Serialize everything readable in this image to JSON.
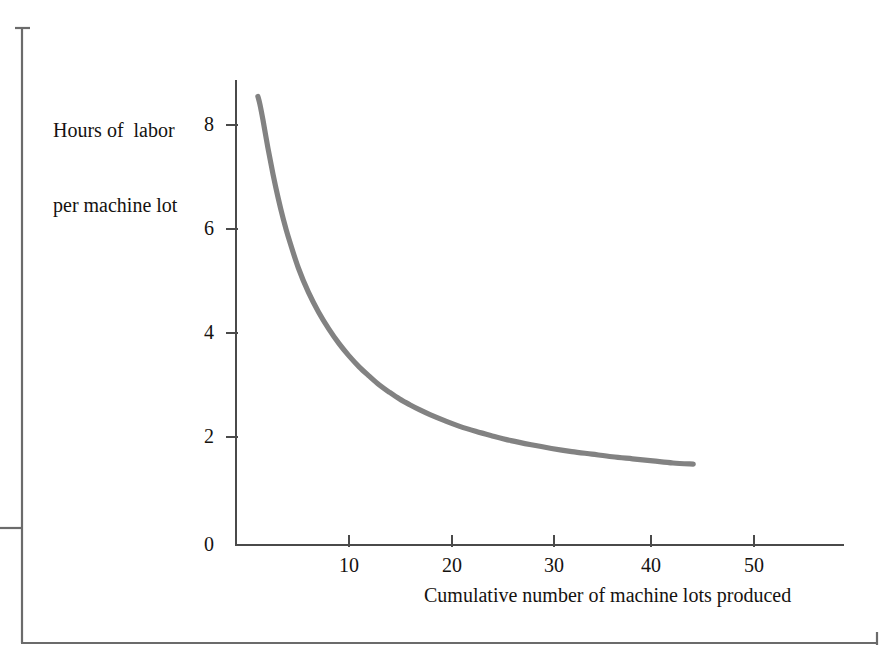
{
  "figure": {
    "background_color": "#ffffff",
    "axis_color": "#4a4a4a",
    "curve_color": "#828282",
    "text_color": "#15120f",
    "frame": {
      "name": "page-rule-frame",
      "left_rule_x": 22,
      "left_rule_top": 28,
      "left_rule_bottom": 643,
      "top_tick_width": 14,
      "mid_tick_y": 528,
      "bottom_rule_y": 643,
      "bottom_rule_right": 877,
      "right_tick_height": 14
    }
  },
  "chart_data": {
    "type": "line",
    "title": "",
    "subtitle": "",
    "xlabel": "Cumulative number of machine lots produced",
    "ylabel": "Hours of  labor\nper machine lot",
    "ylabel_line1": "Hours of  labor",
    "ylabel_line2": "per machine lot",
    "xlim": [
      0,
      59
    ],
    "ylim": [
      0,
      8.7
    ],
    "xticks": [
      10,
      20,
      30,
      40,
      50
    ],
    "xtick_labels": [
      "10",
      "20",
      "30",
      "40",
      "50"
    ],
    "yticks": [
      0,
      2,
      4,
      6,
      8
    ],
    "ytick_labels": [
      "0",
      "2",
      "4",
      "6",
      "8"
    ],
    "grid": false,
    "legend": null,
    "series": [
      {
        "name": "Learning curve",
        "x": [
          1.0,
          1.2,
          1.5,
          2.0,
          2.5,
          3.0,
          3.5,
          4.0,
          5.0,
          6.0,
          7.0,
          8.0,
          9.0,
          10.0,
          11.0,
          12.0,
          13.0,
          14.0,
          15.0,
          16.0,
          17.0,
          18.0,
          19.5,
          21.0,
          22.5,
          24.0,
          26.0,
          28.0,
          30.0,
          32.0,
          34.0,
          36.0,
          38.0,
          40.0,
          42.0,
          44.0
        ],
        "y": [
          8.55,
          8.4,
          8.1,
          7.55,
          7.05,
          6.6,
          6.2,
          5.85,
          5.25,
          4.78,
          4.4,
          4.08,
          3.8,
          3.56,
          3.35,
          3.17,
          3.0,
          2.86,
          2.73,
          2.62,
          2.52,
          2.43,
          2.31,
          2.2,
          2.11,
          2.03,
          1.93,
          1.85,
          1.78,
          1.72,
          1.67,
          1.62,
          1.58,
          1.54,
          1.5,
          1.48
        ]
      }
    ],
    "annotations": []
  },
  "labels": {
    "y_title_line1": "Hours of  labor",
    "y_title_line2": "per machine lot",
    "x_title": "Cumulative number of machine lots produced"
  }
}
